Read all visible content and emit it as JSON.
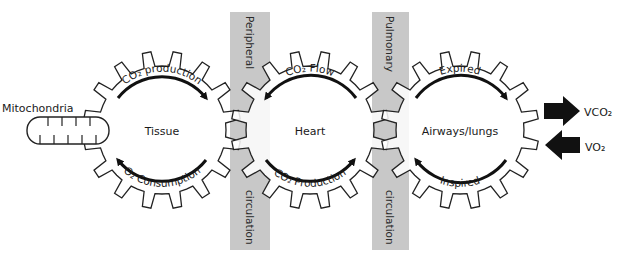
{
  "diagram": {
    "colors": {
      "bar": "#c8c8c8",
      "stroke": "#222222",
      "arrow": "#111111",
      "overlap": "#bdbdbd"
    },
    "bars": [
      {
        "top_label": "Peripheral",
        "bottom_label": "circulation"
      },
      {
        "top_label": "Pulmonary",
        "bottom_label": "circulation"
      }
    ],
    "gears": [
      {
        "name": "Tissue",
        "top_arc": "CO₂ production",
        "bottom_arc": "O₂ Consumption"
      },
      {
        "name": "Heart",
        "top_arc": "CO₂ Flow",
        "bottom_arc": "CO₂ Production"
      },
      {
        "name": "Airways/lungs",
        "top_arc": "Expired",
        "bottom_arc": "Inspired"
      }
    ],
    "mitochondria_label": "Mitochondria",
    "outputs": [
      {
        "label": "VCO₂",
        "direction": "out"
      },
      {
        "label": "VO₂",
        "direction": "in"
      }
    ]
  }
}
